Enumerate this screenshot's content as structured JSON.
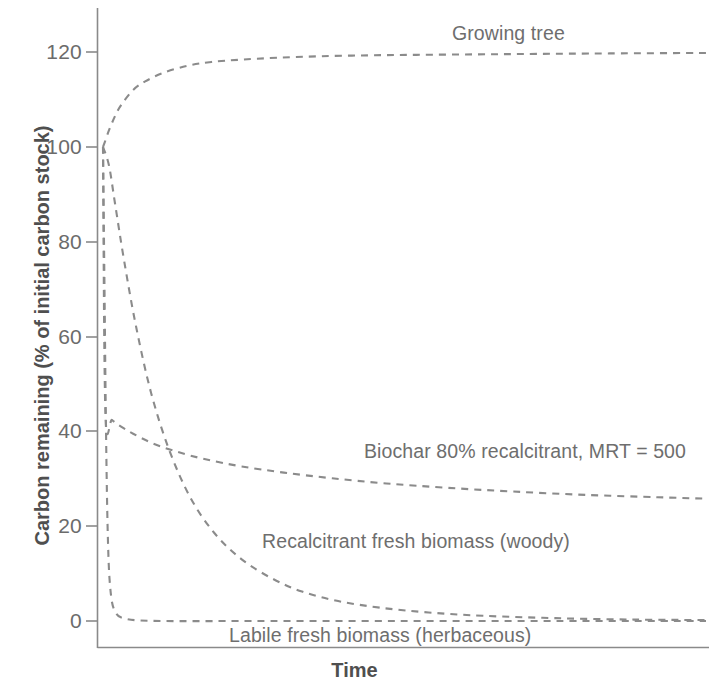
{
  "chart_data": {
    "type": "line",
    "title": "",
    "xlabel": "Time",
    "ylabel": "Carbon remaining (% of initial carbon stock)",
    "xlim": [
      0,
      100
    ],
    "ylim": [
      -3,
      130
    ],
    "grid": false,
    "legend_position": "inline-annotations",
    "y_ticks": [
      0,
      20,
      40,
      60,
      80,
      100,
      120
    ],
    "y_tick_labels": [
      "0",
      "20",
      "40",
      "60",
      "80",
      "100",
      "120"
    ],
    "x_ticks": [],
    "x_tick_labels": [],
    "line_style": "dashed",
    "line_color": "#8b8b8b",
    "series": [
      {
        "name": "Growing tree",
        "label": "Growing tree",
        "x": [
          0,
          0.3,
          1,
          2,
          3,
          5,
          7,
          10,
          14,
          18,
          23,
          29,
          36,
          44,
          52,
          62,
          72,
          84,
          100
        ],
        "values": [
          100,
          101,
          103.5,
          106.5,
          108.8,
          112,
          113.8,
          115.6,
          117.1,
          117.9,
          118.4,
          118.8,
          119.1,
          119.3,
          119.4,
          119.5,
          119.6,
          119.7,
          119.8
        ]
      },
      {
        "name": "Biochar 80% recalcitrant, MRT = 500",
        "label": "Biochar 80% recalcitrant, MRT = 500",
        "x": [
          0,
          0.4,
          1.5,
          3,
          5,
          8,
          12,
          17,
          23,
          30,
          38,
          47,
          57,
          68,
          80,
          92,
          100
        ],
        "values": [
          100,
          44.0,
          42.4,
          41.0,
          39.5,
          37.6,
          35.8,
          34.1,
          32.6,
          31.3,
          30.1,
          29.0,
          28.1,
          27.3,
          26.6,
          26.1,
          25.8
        ]
      },
      {
        "name": "Recalcitrant fresh biomass (woody)",
        "label": "Recalcitrant fresh biomass (woody)",
        "x": [
          0,
          1,
          2,
          3.5,
          5.5,
          8,
          11,
          14.5,
          18.5,
          23,
          28,
          33,
          39,
          46,
          54,
          63,
          75,
          88,
          100
        ],
        "values": [
          100,
          96,
          88,
          76,
          62,
          48,
          36,
          26,
          18.5,
          13,
          9,
          6.2,
          4.2,
          2.8,
          1.8,
          1.1,
          0.6,
          0.3,
          0.2
        ]
      },
      {
        "name": "Labile fresh biomass (herbaceous)",
        "label": "Labile fresh biomass (herbaceous)",
        "x": [
          0,
          0.25,
          0.5,
          0.8,
          1.2,
          2,
          4,
          10,
          25,
          50,
          75,
          100
        ],
        "values": [
          100,
          70,
          40,
          18,
          7,
          2,
          0.4,
          0,
          0,
          0,
          0,
          0
        ]
      }
    ],
    "annotations": [
      {
        "text": "Growing tree",
        "x_px": 452,
        "y_px": 22
      },
      {
        "text": "Biochar 80% recalcitrant, MRT = 500",
        "x_px": 364,
        "y_px": 440
      },
      {
        "text": "Recalcitrant fresh biomass (woody)",
        "x_px": 262,
        "y_px": 530
      },
      {
        "text": "Labile fresh biomass (herbaceous)",
        "x_px": 229,
        "y_px": 624
      }
    ]
  },
  "axis": {
    "y_title": "Carbon remaining (% of initial carbon stock)",
    "x_title": "Time",
    "ticks": {
      "t120": "120",
      "t100": "100",
      "t80": "80",
      "t60": "60",
      "t40": "40",
      "t20": "20",
      "t0": "0"
    }
  },
  "labels": {
    "growing_tree": "Growing tree",
    "biochar": "Biochar 80% recalcitrant, MRT = 500",
    "recalcitrant": "Recalcitrant fresh biomass (woody)",
    "labile": "Labile fresh biomass (herbaceous)"
  },
  "style": {
    "line_color": "#8b8b8b",
    "axis_color": "#8a8a8a",
    "text_color": "#5c5c5c"
  }
}
